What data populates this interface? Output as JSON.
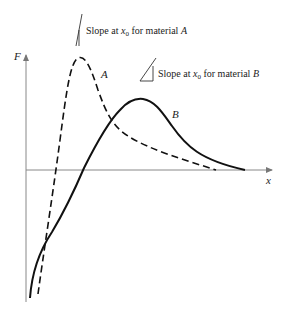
{
  "figure": {
    "axes": {
      "x_label": "x",
      "y_label": "F"
    },
    "curves": [
      {
        "name": "A",
        "style": "dashed",
        "label": "A"
      },
      {
        "name": "B",
        "style": "solid",
        "label": "B"
      }
    ],
    "annotations": {
      "slope_a": {
        "prefix": "Slope at ",
        "var": "x",
        "sub": "0",
        "suffix": " for material ",
        "material": "A"
      },
      "slope_b": {
        "prefix": "Slope at ",
        "var": "x",
        "sub": "0",
        "suffix": " for material ",
        "material": "B"
      }
    },
    "colors": {
      "line": "#111111",
      "axis": "#888888",
      "text": "#222222"
    }
  }
}
